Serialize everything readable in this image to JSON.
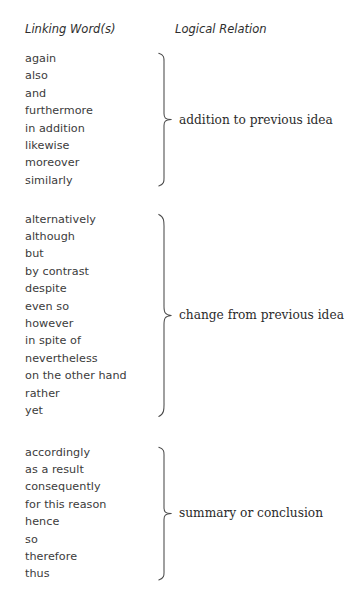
{
  "headers": {
    "left": "Linking Word(s)",
    "right": "Logical Relation"
  },
  "colors": {
    "background": "#ffffff",
    "word_text": "#3b3b3b",
    "relation_text": "#2b2b2b",
    "header_text": "#2e2e2e",
    "brace_stroke": "#4a4a4a"
  },
  "groups": [
    {
      "relation": "addition to previous idea",
      "words": [
        "again",
        "also",
        "and",
        "furthermore",
        "in addition",
        "likewise",
        "moreover",
        "similarly"
      ]
    },
    {
      "relation": "change from previous idea",
      "words": [
        "alternatively",
        "although",
        "but",
        "by contrast",
        "despite",
        "even so",
        "however",
        "in spite of",
        "nevertheless",
        "on the other hand",
        "rather",
        "yet"
      ]
    },
    {
      "relation": "summary or conclusion",
      "words": [
        "accordingly",
        "as a result",
        "consequently",
        "for this reason",
        "hence",
        "so",
        "therefore",
        "thus"
      ]
    }
  ]
}
